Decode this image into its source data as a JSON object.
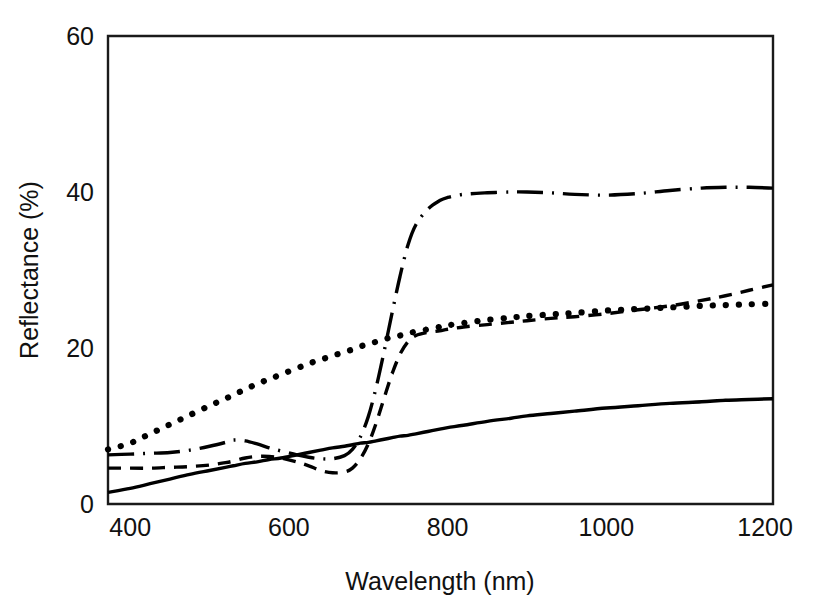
{
  "figure": {
    "background_color": "#ffffff",
    "ink_color": "#000000"
  },
  "chart_data": {
    "type": "line",
    "title": "",
    "subtitle": "",
    "xlabel": "Wavelength (nm)",
    "ylabel": "Reflectance (%)",
    "xlim": [
      372,
      1210
    ],
    "ylim": [
      0,
      60
    ],
    "xticks": [
      400,
      600,
      800,
      1000,
      1200
    ],
    "xtick_labels": [
      "400",
      "600",
      "800",
      "1000",
      "1200"
    ],
    "yticks": [
      0,
      20,
      40,
      60
    ],
    "ytick_labels": [
      "0",
      "20",
      "40",
      "60"
    ],
    "grid": false,
    "legend": null,
    "legend_position": "none",
    "frame": "box",
    "annotations": [],
    "x": [
      372,
      400,
      425,
      450,
      475,
      500,
      520,
      530,
      545,
      560,
      575,
      590,
      610,
      625,
      640,
      655,
      670,
      680,
      690,
      700,
      710,
      720,
      730,
      740,
      750,
      760,
      775,
      790,
      800,
      820,
      850,
      880,
      900,
      930,
      960,
      1000,
      1040,
      1080,
      1120,
      1150,
      1180,
      1210
    ],
    "series": [
      {
        "name": "solid-curve",
        "style": "solid",
        "values": [
          1.5,
          2.0,
          2.6,
          3.2,
          3.8,
          4.3,
          4.7,
          4.9,
          5.2,
          5.4,
          5.7,
          5.9,
          6.3,
          6.6,
          6.9,
          7.2,
          7.4,
          7.6,
          7.8,
          7.9,
          8.1,
          8.3,
          8.5,
          8.7,
          8.8,
          9.0,
          9.3,
          9.6,
          9.8,
          10.1,
          10.6,
          11.0,
          11.3,
          11.6,
          11.9,
          12.3,
          12.6,
          12.9,
          13.1,
          13.3,
          13.4,
          13.5
        ]
      },
      {
        "name": "dashed-curve",
        "style": "dashed",
        "values": [
          4.6,
          4.6,
          4.6,
          4.7,
          4.8,
          5.0,
          5.3,
          5.5,
          5.9,
          6.1,
          6.1,
          5.9,
          5.4,
          4.9,
          4.3,
          4.0,
          4.1,
          4.6,
          5.8,
          7.7,
          10.4,
          13.6,
          16.7,
          19.2,
          20.8,
          21.6,
          22.0,
          22.2,
          22.4,
          22.7,
          23.0,
          23.3,
          23.5,
          23.8,
          24.0,
          24.4,
          24.9,
          25.4,
          26.1,
          26.7,
          27.4,
          28.1
        ]
      },
      {
        "name": "dash-dot-curve",
        "style": "dashdot",
        "values": [
          6.3,
          6.4,
          6.5,
          6.6,
          6.9,
          7.4,
          7.9,
          8.2,
          8.1,
          7.7,
          7.2,
          6.8,
          6.3,
          6.0,
          5.8,
          5.8,
          6.2,
          7.0,
          8.6,
          11.2,
          15.0,
          19.6,
          24.5,
          29.2,
          33.2,
          35.8,
          37.8,
          38.9,
          39.3,
          39.7,
          39.9,
          40.0,
          40.0,
          39.9,
          39.7,
          39.6,
          39.8,
          40.2,
          40.5,
          40.6,
          40.6,
          40.5
        ]
      },
      {
        "name": "dotted-curve",
        "style": "dotted",
        "values": [
          7.0,
          7.8,
          9.0,
          10.2,
          11.4,
          12.6,
          13.5,
          14.0,
          14.7,
          15.4,
          16.0,
          16.6,
          17.4,
          18.0,
          18.5,
          19.0,
          19.5,
          19.8,
          20.2,
          20.5,
          20.8,
          21.1,
          21.4,
          21.6,
          21.9,
          22.1,
          22.4,
          22.7,
          22.9,
          23.2,
          23.6,
          23.9,
          24.1,
          24.3,
          24.5,
          24.8,
          25.0,
          25.2,
          25.4,
          25.5,
          25.6,
          25.7
        ]
      }
    ]
  }
}
